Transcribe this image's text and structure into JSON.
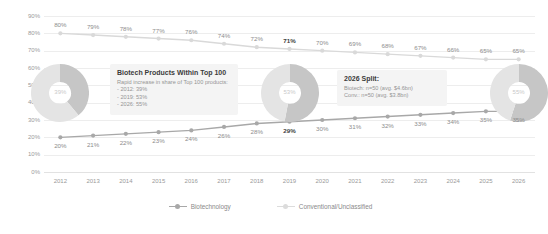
{
  "chart_data": {
    "type": "line",
    "title": "",
    "xlabel": "",
    "ylabel": "Technology % of Prescription & OTC Sales",
    "ylim": [
      0,
      90
    ],
    "ytick_labels": [
      "90%",
      "80%",
      "70%",
      "60%",
      "50%",
      "40%",
      "30%",
      "20%",
      "10%",
      "0%"
    ],
    "ytick_values": [
      90,
      80,
      70,
      60,
      50,
      40,
      30,
      20,
      10,
      0
    ],
    "grid": true,
    "legend_position": "bottom",
    "categories": [
      2012,
      2013,
      2014,
      2015,
      2016,
      2017,
      2018,
      2019,
      2020,
      2021,
      2022,
      2023,
      2024,
      2025,
      2026
    ],
    "category_labels": [
      "2012",
      "2013",
      "2014",
      "2015",
      "2016",
      "2017",
      "2018",
      "2019",
      "2020",
      "2021",
      "2022",
      "2023",
      "2024",
      "2025",
      "2026"
    ],
    "series": [
      {
        "name": "Conventional/Unclassified",
        "color": "#d9d9d9",
        "values": [
          80,
          79,
          78,
          77,
          76,
          74,
          72,
          71,
          70,
          69,
          68,
          67,
          66,
          65,
          65
        ],
        "labels": [
          "80%",
          "79%",
          "78%",
          "77%",
          "76%",
          "74%",
          "72%",
          "71%",
          "70%",
          "69%",
          "68%",
          "67%",
          "66%",
          "65%",
          "65%"
        ],
        "highlight_index": 7
      },
      {
        "name": "Biotechnology",
        "color": "#a8a8a8",
        "values": [
          20,
          21,
          22,
          23,
          24,
          26,
          28,
          29,
          30,
          31,
          32,
          33,
          34,
          35,
          35
        ],
        "labels": [
          "20%",
          "21%",
          "22%",
          "23%",
          "24%",
          "26%",
          "28%",
          "29%",
          "30%",
          "31%",
          "32%",
          "33%",
          "34%",
          "35%",
          "35%"
        ],
        "highlight_index": 7
      }
    ],
    "donuts": [
      {
        "year": 2012,
        "value": 39,
        "label": "39%",
        "rest_label": "61%"
      },
      {
        "year": 2019,
        "value": 53,
        "label": "53%",
        "rest_label": "47%"
      },
      {
        "year": 2026,
        "value": 55,
        "label": "55%",
        "rest_label": "45%"
      }
    ],
    "annotations": [
      {
        "title": "Biotech Products Within Top 100",
        "subtitle": "Rapid increase in share of Top 100 products:",
        "lines": [
          "- 2012: 39%",
          "- 2019: 53%",
          "- 2026: 55%"
        ]
      },
      {
        "title": "2026 Split:",
        "subtitle": "",
        "lines": [
          "Biotech: n=50 (avg. $4.6bn)",
          "Conv.: n=50 (avg. $3.8bn)"
        ]
      }
    ]
  },
  "legend": {
    "items": [
      {
        "label": "Biotechnology",
        "color": "#a8a8a8"
      },
      {
        "label": "Conventional/Unclassified",
        "color": "#dcdcdc"
      }
    ]
  },
  "colors": {
    "series_biotech": "#a8a8a8",
    "series_conventional": "#d9d9d9",
    "donut_fill": "#c6c6c6",
    "donut_rest": "#e4e4e4",
    "grid": "#ededed",
    "axis_text": "#9a9a9a",
    "callout_bg": "#f4f4f4"
  }
}
